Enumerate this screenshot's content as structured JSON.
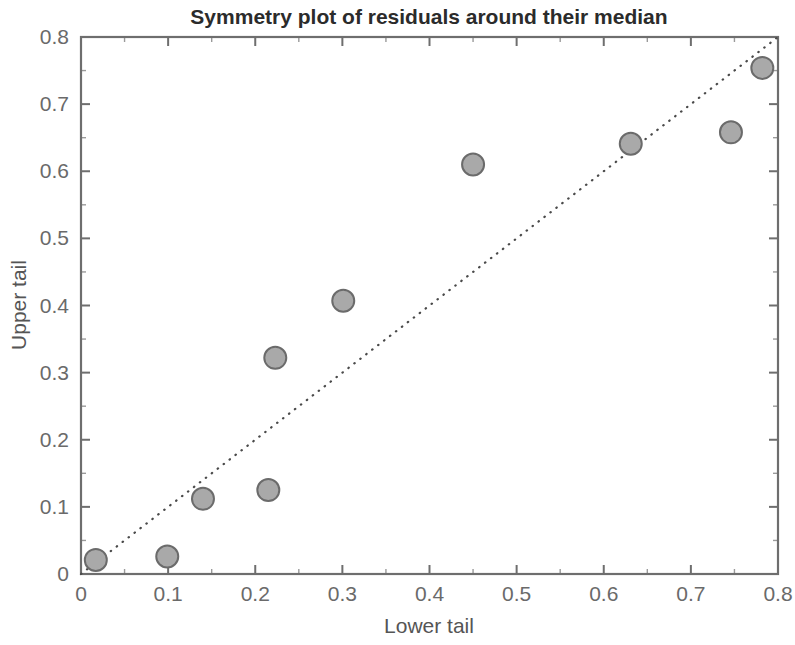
{
  "chart_data": {
    "type": "scatter",
    "title": "Symmetry plot of residuals around their median",
    "xlabel": "Lower tail",
    "ylabel": "Upper tail",
    "xlim": [
      0,
      0.8
    ],
    "ylim": [
      0,
      0.8
    ],
    "xticks": [
      "0",
      "0.1",
      "0.2",
      "0.3",
      "0.4",
      "0.5",
      "0.6",
      "0.7",
      "0.8"
    ],
    "xtick_values": [
      0,
      0.1,
      0.2,
      0.3,
      0.4,
      0.5,
      0.6,
      0.7,
      0.8
    ],
    "yticks": [
      "0",
      "0.1",
      "0.2",
      "0.3",
      "0.4",
      "0.5",
      "0.6",
      "0.7",
      "0.8"
    ],
    "ytick_values": [
      0,
      0.1,
      0.2,
      0.3,
      0.4,
      0.5,
      0.6,
      0.7,
      0.8
    ],
    "grid": false,
    "legend": null,
    "minor_ticks": true,
    "marker": {
      "shape": "circle",
      "fill_color": "#a9a9a9",
      "edge_color": "#6b6b6b",
      "size_px": 11
    },
    "reference_line": {
      "name": "y = x diagonal",
      "style": "dotted",
      "color": "#4a4a4a",
      "from": [
        0,
        0
      ],
      "to": [
        0.8,
        0.8
      ]
    },
    "points": [
      {
        "x": 0.017,
        "y": 0.021
      },
      {
        "x": 0.099,
        "y": 0.026
      },
      {
        "x": 0.14,
        "y": 0.112
      },
      {
        "x": 0.215,
        "y": 0.125
      },
      {
        "x": 0.223,
        "y": 0.322
      },
      {
        "x": 0.301,
        "y": 0.407
      },
      {
        "x": 0.45,
        "y": 0.61
      },
      {
        "x": 0.631,
        "y": 0.641
      },
      {
        "x": 0.746,
        "y": 0.658
      },
      {
        "x": 0.782,
        "y": 0.754
      }
    ]
  },
  "plot_area": {
    "left": 81,
    "right": 778,
    "top": 37,
    "bottom": 574
  }
}
